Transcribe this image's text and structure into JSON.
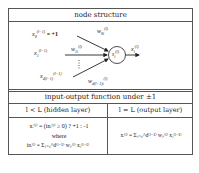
{
  "node_structure": {
    "title": "node structure",
    "inputs": [
      {
        "var": "x",
        "sub": "0",
        "sup": "(l−1)",
        "suffix": " = +1",
        "weight": "w",
        "weight_sub": "0i",
        "weight_sup": "(l)"
      },
      {
        "var": "x",
        "sub": "1",
        "sup": "(l−1)",
        "suffix": "",
        "weight": "w",
        "weight_sub": "1i",
        "weight_sup": "(l)"
      },
      {
        "var": "x",
        "sub": "d(l−1)",
        "sup": "(l−1)",
        "suffix": "",
        "weight": "w",
        "weight_sub": "d(l−1)i",
        "weight_sup": "(l)"
      }
    ],
    "ellipsis": "⋮",
    "node": {
      "var": "s",
      "sub": "i",
      "sup": "(l)"
    },
    "output": {
      "var": "x",
      "sub": "i",
      "sup": "(l)"
    }
  },
  "io_function": {
    "title": "input-output function under ±1",
    "columns": [
      {
        "header": "l < L (hidden layer)",
        "line1": "xᵢ⁽ˡ⁾ = (inᵢ⁽ˡ⁾ ≥ 0) ? +1 : -1",
        "line2": "where",
        "line3": "inᵢ⁽ˡ⁾ = Σⱼ₌₀^d⁽ˡ⁻¹⁾ wⱼᵢ⁽ˡ⁾ xⱼ⁽ˡ⁻¹⁾"
      },
      {
        "header": "l = L (output layer)",
        "line1": "xᵢ⁽ˡ⁾ = Σⱼ₌₀^d⁽ˡ⁻¹⁾ wⱼᵢ⁽ˡ⁾ xⱼ⁽ˡ⁻¹⁾"
      }
    ]
  },
  "colors": {
    "border": "#555555",
    "text": "#222222",
    "background": "#ffffff"
  }
}
